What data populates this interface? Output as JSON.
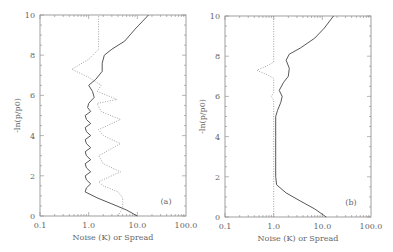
{
  "chart_data": [
    {
      "type": "line",
      "panel_label": "(a)",
      "xlabel": "Noise (K) or Spread",
      "ylabel": "-ln(p/p0)",
      "xscale": "log",
      "xlim": [
        0.1,
        100.0
      ],
      "ylim": [
        0,
        10
      ],
      "xticks": [
        "0.1",
        "1.0",
        "10.0",
        "100.0"
      ],
      "yticks": [
        "0",
        "2",
        "4",
        "6",
        "8",
        "10"
      ],
      "grid": false,
      "series": [
        {
          "name": "Noise (solid)",
          "style": "solid",
          "points": [
            [
              10.0,
              0
            ],
            [
              6.0,
              0.3
            ],
            [
              3.0,
              0.6
            ],
            [
              1.5,
              0.9
            ],
            [
              0.85,
              1.2
            ],
            [
              0.9,
              1.4
            ],
            [
              1.1,
              1.6
            ],
            [
              0.9,
              1.8
            ],
            [
              0.85,
              2.0
            ],
            [
              1.1,
              2.2
            ],
            [
              0.9,
              2.4
            ],
            [
              0.85,
              2.6
            ],
            [
              1.1,
              2.8
            ],
            [
              0.9,
              3.0
            ],
            [
              0.85,
              3.2
            ],
            [
              1.1,
              3.4
            ],
            [
              0.9,
              3.6
            ],
            [
              0.85,
              3.8
            ],
            [
              1.1,
              4.0
            ],
            [
              0.9,
              4.2
            ],
            [
              0.85,
              4.4
            ],
            [
              1.1,
              4.6
            ],
            [
              0.9,
              4.8
            ],
            [
              0.85,
              5.0
            ],
            [
              1.1,
              5.2
            ],
            [
              0.95,
              5.4
            ],
            [
              1.0,
              5.6
            ],
            [
              1.3,
              5.9
            ],
            [
              1.2,
              6.2
            ],
            [
              1.0,
              6.5
            ],
            [
              1.4,
              6.8
            ],
            [
              1.9,
              7.2
            ],
            [
              1.9,
              7.6
            ],
            [
              2.1,
              8.0
            ],
            [
              3.0,
              8.3
            ],
            [
              5.5,
              8.7
            ],
            [
              9.0,
              9.3
            ],
            [
              17.0,
              10.0
            ]
          ]
        },
        {
          "name": "Spread (dotted)",
          "style": "dotted",
          "points": [
            [
              4.0,
              0
            ],
            [
              5.0,
              0.4
            ],
            [
              5.0,
              0.9
            ],
            [
              4.0,
              1.2
            ],
            [
              2.0,
              1.5
            ],
            [
              1.6,
              1.7
            ],
            [
              4.5,
              2.2
            ],
            [
              2.0,
              2.6
            ],
            [
              1.6,
              3.0
            ],
            [
              4.5,
              3.6
            ],
            [
              2.0,
              4.0
            ],
            [
              1.6,
              4.3
            ],
            [
              4.5,
              4.8
            ],
            [
              1.8,
              5.2
            ],
            [
              1.5,
              5.6
            ],
            [
              3.8,
              5.8
            ],
            [
              1.5,
              6.2
            ],
            [
              1.8,
              6.5
            ],
            [
              1.0,
              6.9
            ],
            [
              0.45,
              7.3
            ],
            [
              1.0,
              7.8
            ],
            [
              1.6,
              8.3
            ],
            [
              1.6,
              9.0
            ],
            [
              1.6,
              10.0
            ]
          ]
        }
      ]
    },
    {
      "type": "line",
      "panel_label": "(b)",
      "xlabel": "Noise (K) or Spread",
      "ylabel": "-ln(p/p0)",
      "xscale": "log",
      "xlim": [
        0.1,
        100.0
      ],
      "ylim": [
        0,
        10
      ],
      "xticks": [
        "0.1",
        "1.0",
        "10.0",
        "100.0"
      ],
      "yticks": [
        "0",
        "2",
        "4",
        "6",
        "8",
        "10"
      ],
      "grid": false,
      "series": [
        {
          "name": "Noise (solid)",
          "style": "solid",
          "points": [
            [
              12.0,
              0
            ],
            [
              7.0,
              0.4
            ],
            [
              3.5,
              0.8
            ],
            [
              1.8,
              1.2
            ],
            [
              1.15,
              1.6
            ],
            [
              1.1,
              2.0
            ],
            [
              1.1,
              3.0
            ],
            [
              1.1,
              4.0
            ],
            [
              1.1,
              5.0
            ],
            [
              1.2,
              5.3
            ],
            [
              1.4,
              5.7
            ],
            [
              1.5,
              6.0
            ],
            [
              1.3,
              6.3
            ],
            [
              1.6,
              6.7
            ],
            [
              2.0,
              7.0
            ],
            [
              2.1,
              7.4
            ],
            [
              1.8,
              7.8
            ],
            [
              2.1,
              8.1
            ],
            [
              3.5,
              8.4
            ],
            [
              7.0,
              8.9
            ],
            [
              11.0,
              9.4
            ],
            [
              17.0,
              10.0
            ]
          ]
        },
        {
          "name": "Spread (dotted)",
          "style": "dotted",
          "points": [
            [
              1.0,
              0
            ],
            [
              1.0,
              5.8
            ],
            [
              0.9,
              6.0
            ],
            [
              1.0,
              6.2
            ],
            [
              1.0,
              6.9
            ],
            [
              0.7,
              7.1
            ],
            [
              0.45,
              7.3
            ],
            [
              0.7,
              7.5
            ],
            [
              1.0,
              7.7
            ],
            [
              1.0,
              10.0
            ]
          ]
        }
      ]
    }
  ],
  "panels": [
    {
      "label": "(a)",
      "xlabel": "Noise (K) or Spread",
      "ylabel": "-ln(p/p0)"
    },
    {
      "label": "(b)",
      "xlabel": "Noise (K) or Spread",
      "ylabel": "-ln(p/p0)"
    }
  ]
}
